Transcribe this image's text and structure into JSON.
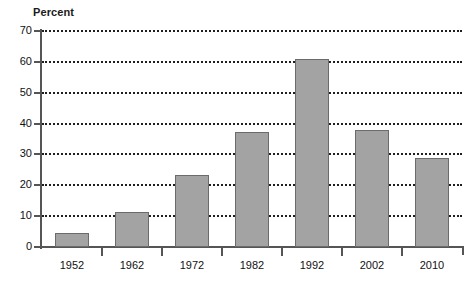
{
  "chart_data": {
    "type": "bar",
    "title": "",
    "ylabel": "Percent",
    "xlabel": "",
    "categories": [
      "1952",
      "1962",
      "1972",
      "1982",
      "1992",
      "2002",
      "2010"
    ],
    "values": [
      4.5,
      11.5,
      23.5,
      37.2,
      60.8,
      37.8,
      29.0
    ],
    "ylim": [
      0,
      70
    ],
    "ytick_labels": [
      "0",
      "10",
      "20",
      "30",
      "40",
      "50",
      "60",
      "70"
    ],
    "ytick_values": [
      0,
      10,
      20,
      30,
      40,
      50,
      60,
      70
    ],
    "grid": "horizontal-dotted",
    "legend": "none",
    "bar_fill_color": "#a3a3a3",
    "bar_border_color": "#6b6b6b",
    "axis_color": "#555555",
    "gridline_color": "#1f1f1f",
    "background_color": "#ffffff"
  }
}
